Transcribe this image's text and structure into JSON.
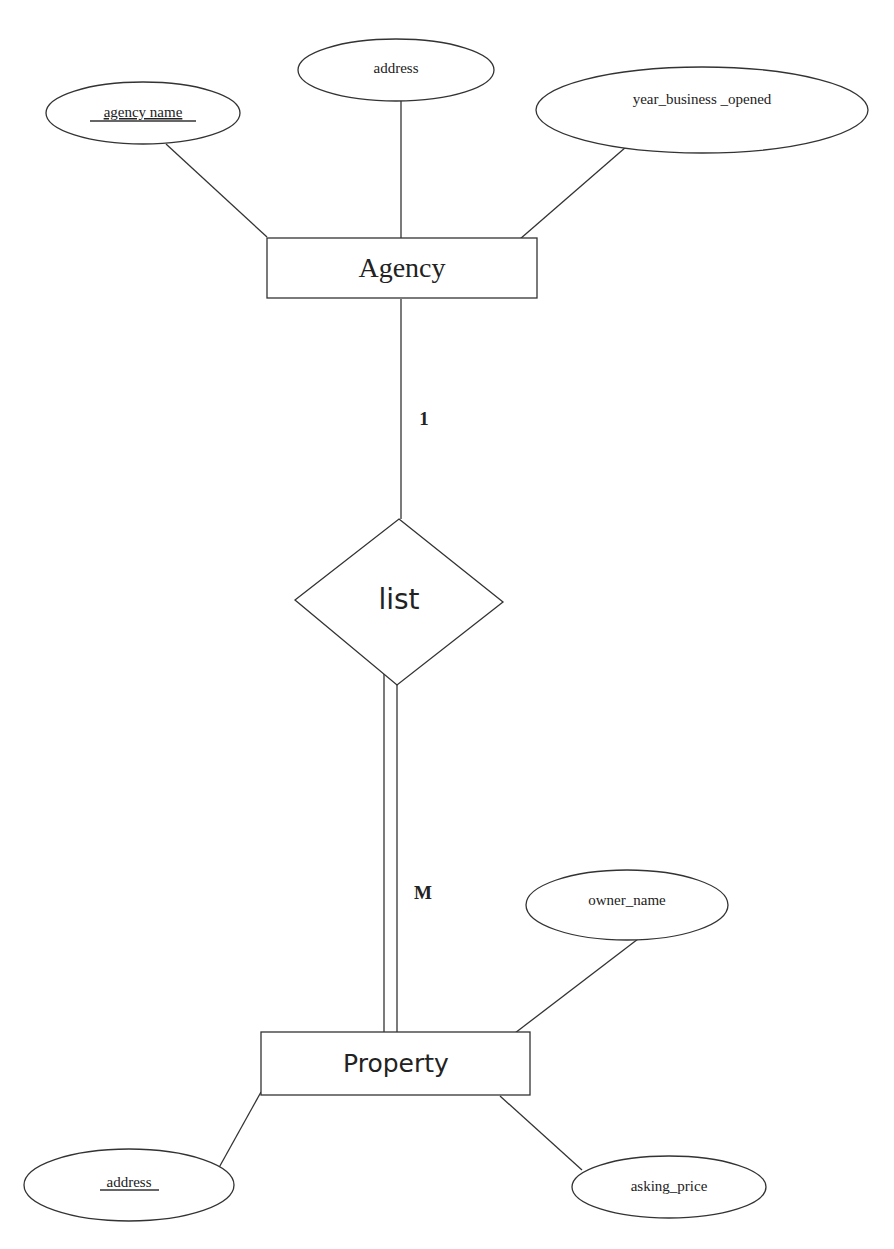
{
  "diagram": {
    "type": "ER diagram",
    "entities": {
      "agency": {
        "label": "Agency"
      },
      "property": {
        "label": "Property"
      }
    },
    "relationship": {
      "label": "list"
    },
    "cardinality": {
      "agency_side": "1",
      "property_side": "M"
    },
    "attributes": {
      "agency_name": {
        "label": "agency name",
        "key": true
      },
      "agency_address": {
        "label": "address",
        "key": false
      },
      "year_business_opened": {
        "label": "year_business _opened",
        "key": false
      },
      "owner_name": {
        "label": "owner_name",
        "key": false
      },
      "property_address": {
        "label": "address",
        "key": true
      },
      "asking_price": {
        "label": "asking_price",
        "key": false
      }
    },
    "participation": {
      "agency": "partial",
      "property": "total"
    }
  }
}
